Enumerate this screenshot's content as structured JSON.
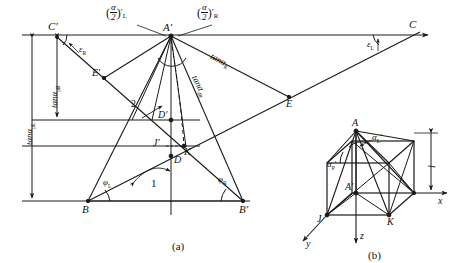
{
  "figure": {
    "title_caption_a": "(a)",
    "title_caption_b": "(b)"
  },
  "panel_a": {
    "dimensions": {
      "outer_label": "tanα",
      "outer_sub": "pL",
      "inner_label": "tanα",
      "inner_sub": "pR"
    },
    "points": [
      {
        "name": "C-prime",
        "label": "C",
        "prime": "′"
      },
      {
        "name": "A-prime",
        "label": "A",
        "prime": "′"
      },
      {
        "name": "C",
        "label": "C",
        "prime": ""
      },
      {
        "name": "E-prime",
        "label": "E",
        "prime": "′"
      },
      {
        "name": "E",
        "label": "E",
        "prime": ""
      },
      {
        "name": "D-prime",
        "label": "D",
        "prime": "′"
      },
      {
        "name": "D",
        "label": "D",
        "prime": ""
      },
      {
        "name": "J-prime",
        "label": "J",
        "prime": "′"
      },
      {
        "name": "K",
        "label": "K",
        "prime": ""
      },
      {
        "name": "B",
        "label": "B",
        "prime": ""
      },
      {
        "name": "B-prime",
        "label": "B",
        "prime": "′"
      }
    ],
    "angles": {
      "half_alpha_left_base": "α",
      "half_alpha_left_den": "2",
      "half_alpha_left_sub": "L",
      "half_alpha_left_prime": "′",
      "half_alpha_right_base": "α",
      "half_alpha_right_den": "2",
      "half_alpha_right_sub": "R",
      "half_alpha_right_prime": "′",
      "epsilon_right": "ε",
      "epsilon_right_sub": "R",
      "epsilon_left": "ε",
      "epsilon_left_sub": "L",
      "phi_left": "φ",
      "phi_left_sub": "L",
      "phi_right": "φ",
      "phi_right_sub": "R"
    },
    "edge_labels": {
      "tan_alpha_R": "tanα",
      "tan_alpha_R_sub": "R",
      "tan_alpha_dR": "tanα",
      "tan_alpha_dR_sub": "dR"
    },
    "callouts": [
      {
        "name": "callout-2",
        "label": "2"
      },
      {
        "name": "callout-1",
        "label": "1"
      }
    ]
  },
  "panel_b": {
    "points": [
      {
        "name": "A-top",
        "label": "A",
        "prime": ""
      },
      {
        "name": "A-prime-center",
        "label": "A",
        "prime": "′"
      },
      {
        "name": "J-bottom",
        "label": "J",
        "prime": ""
      },
      {
        "name": "K-bottom",
        "label": "K",
        "prime": ""
      }
    ],
    "axes": [
      {
        "name": "x-axis",
        "label": "x"
      },
      {
        "name": "y-axis",
        "label": "y"
      },
      {
        "name": "z-axis",
        "label": "z"
      }
    ],
    "angles": {
      "alpha_L_prime": "α",
      "alpha_L_prime_sub": "L",
      "alpha_L_prime_mark": "′",
      "alpha_P_prime": "α",
      "alpha_P_prime_sub": "P",
      "alpha_P_prime_mark": "′"
    },
    "dimension": {
      "label": "l"
    }
  },
  "style": {
    "line_color": "#1a1a1a",
    "background": "#ffffff"
  }
}
